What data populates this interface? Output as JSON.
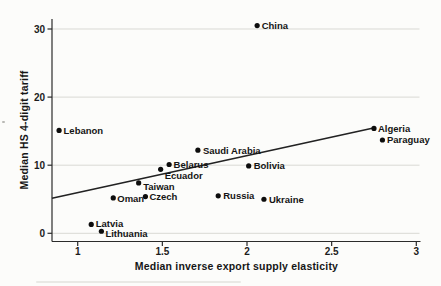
{
  "chart_data": {
    "type": "scatter",
    "title": "",
    "xlabel": "Median inverse export supply elasticity",
    "ylabel": "Median HS 4-digit tariff",
    "xlim": [
      0.85,
      3.03
    ],
    "ylim": [
      -1.3,
      31.5
    ],
    "grid": "horizontal-only",
    "legend": "none",
    "grid_color": "#d9d9d4",
    "axis_color": "#2b2b2b",
    "point_color": "#0d0d0d",
    "trend_color": "#222222",
    "x_ticks": [
      {
        "value": 1,
        "label": "1"
      },
      {
        "value": 1.5,
        "label": "1.5"
      },
      {
        "value": 2,
        "label": "2"
      },
      {
        "value": 2.5,
        "label": "2.5"
      },
      {
        "value": 3,
        "label": "3"
      }
    ],
    "y_ticks": [
      {
        "value": 0,
        "label": "0"
      },
      {
        "value": 10,
        "label": "10"
      },
      {
        "value": 20,
        "label": "20"
      },
      {
        "value": 30,
        "label": "30"
      }
    ],
    "points": [
      {
        "label": "Lebanon",
        "x": 0.89,
        "y": 15.1,
        "dx": 4.5,
        "dy": 0
      },
      {
        "label": "Latvia",
        "x": 1.08,
        "y": 1.3,
        "dx": 4.5,
        "dy": -1
      },
      {
        "label": "Lithuania",
        "x": 1.14,
        "y": 0.3,
        "dx": 4,
        "dy": 2.5
      },
      {
        "label": "Oman",
        "x": 1.21,
        "y": 5.2,
        "dx": 4,
        "dy": 0.5
      },
      {
        "label": "Taiwan",
        "x": 1.36,
        "y": 7.4,
        "dx": 4.5,
        "dy": 4
      },
      {
        "label": "Czech",
        "x": 1.4,
        "y": 5.4,
        "dx": 4,
        "dy": 0
      },
      {
        "label": "Ecuador",
        "x": 1.49,
        "y": 9.4,
        "dx": 4,
        "dy": 6
      },
      {
        "label": "Belarus",
        "x": 1.54,
        "y": 10.1,
        "dx": 4.5,
        "dy": 0
      },
      {
        "label": "Saudi Arabia",
        "x": 1.71,
        "y": 12.2,
        "dx": 5,
        "dy": 0
      },
      {
        "label": "Russia",
        "x": 1.83,
        "y": 5.5,
        "dx": 5,
        "dy": 0
      },
      {
        "label": "Bolivia",
        "x": 2.01,
        "y": 9.9,
        "dx": 5,
        "dy": 0
      },
      {
        "label": "China",
        "x": 2.06,
        "y": 30.5,
        "dx": 4.5,
        "dy": 0
      },
      {
        "label": "Ukraine",
        "x": 2.1,
        "y": 5.0,
        "dx": 5,
        "dy": 0.5
      },
      {
        "label": "Algeria",
        "x": 2.75,
        "y": 15.4,
        "dx": 4,
        "dy": 0
      },
      {
        "label": "Paraguay",
        "x": 2.8,
        "y": 13.7,
        "dx": 4.5,
        "dy": 0
      }
    ],
    "trend_line": {
      "x1": 0.848,
      "y1": 5.15,
      "x2": 2.74,
      "y2": 15.43
    }
  }
}
